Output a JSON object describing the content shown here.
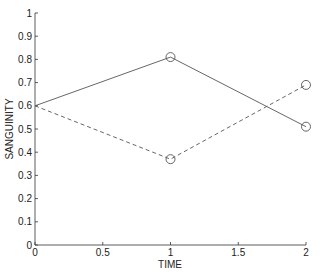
{
  "chart_data": {
    "type": "line",
    "title": "",
    "xlabel": "TIME",
    "ylabel": "SANGUINITY",
    "xlim": [
      0,
      2
    ],
    "ylim": [
      0,
      1
    ],
    "grid": false,
    "legend": null,
    "x_ticks": [
      "0",
      "0.5",
      "1",
      "1.5",
      "2"
    ],
    "y_ticks": [
      "0",
      "0.1",
      "0.2",
      "0.3",
      "0.4",
      "0.5",
      "0.6",
      "0.7",
      "0.8",
      "0.9",
      "1"
    ],
    "x": [
      0,
      1,
      2
    ],
    "series": [
      {
        "name": "solid",
        "style": "solid",
        "values": [
          0.6,
          0.81,
          0.51
        ],
        "markers": [
          false,
          true,
          true
        ]
      },
      {
        "name": "dashed",
        "style": "dashed",
        "values": [
          0.6,
          0.37,
          0.69
        ],
        "markers": [
          false,
          true,
          true
        ]
      }
    ],
    "colors": {
      "line": "#555555",
      "axis": "#333333"
    }
  }
}
